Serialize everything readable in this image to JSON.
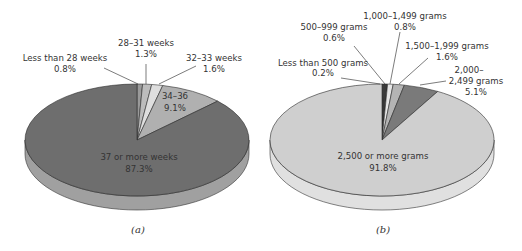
{
  "chart_data": [
    {
      "type": "pie",
      "style": "3d",
      "caption": "(a)",
      "start_angle": "12 o'clock, clockwise",
      "categories": [
        "Less than 28 weeks",
        "28–31 weeks",
        "32–33 weeks",
        "34–36",
        "37 or more weeks"
      ],
      "values": [
        0.8,
        1.3,
        1.6,
        9.1,
        87.3
      ],
      "labels": [
        "0.8%",
        "1.3%",
        "1.6%",
        "9.1%",
        "87.3%"
      ],
      "colors": [
        "#9a9a9a",
        "#bcbcbc",
        "#dedede",
        "#b0b0b0",
        "#6e6e6e"
      ],
      "unit": "%"
    },
    {
      "type": "pie",
      "style": "3d",
      "caption": "(b)",
      "start_angle": "12 o'clock, clockwise",
      "categories": [
        "Less than 500 grams",
        "500–999 grams",
        "1,000–1,499 grams",
        "1,500–1,999 grams",
        "2,000–2,499 grams",
        "2,500 or more grams"
      ],
      "values": [
        0.2,
        0.6,
        0.8,
        1.6,
        5.1,
        91.8
      ],
      "labels": [
        "0.2%",
        "0.6%",
        "0.8%",
        "1.6%",
        "5.1%",
        "91.8%"
      ],
      "colors": [
        "#555555",
        "#3a3a3a",
        "#e6e6e6",
        "#b4b4b4",
        "#7a7a7a",
        "#cfcfcf"
      ],
      "unit": "%"
    }
  ],
  "charts": {
    "a": {
      "caption": "(a)",
      "labels": {
        "s0_line1": "Less than 28 weeks",
        "s0_line2": "0.8%",
        "s1_line1": "28–31 weeks",
        "s1_line2": "1.3%",
        "s2_line1": "32–33 weeks",
        "s2_line2": "1.6%",
        "s3_line1": "34–36",
        "s3_line2": "9.1%",
        "s4_line1": "37 or more weeks",
        "s4_line2": "87.3%"
      }
    },
    "b": {
      "caption": "(b)",
      "labels": {
        "s0_line1": "Less than 500 grams",
        "s0_line2": "0.2%",
        "s1_line1": "500–999 grams",
        "s1_line2": "0.6%",
        "s2_line1": "1,000–1,499 grams",
        "s2_line2": "0.8%",
        "s3_line1": "1,500–1,999 grams",
        "s3_line2": "1.6%",
        "s4_line1": "2,000–",
        "s4_line2": "2,499 grams",
        "s4_line3": "5.1%",
        "s5_line1": "2,500 or more grams",
        "s5_line2": "91.8%"
      }
    }
  }
}
